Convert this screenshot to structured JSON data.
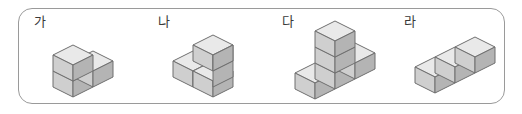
{
  "panel": {
    "border_color": "#9a9a9a",
    "background": "#ffffff",
    "corner_radius_px": 14
  },
  "cube_style": {
    "top_face_color": "#e9e9e9",
    "left_face_color": "#cfcfcf",
    "right_face_color": "#b4b4b4",
    "edge_color": "#6f6f6f",
    "shadow_color": "#dcdcdc"
  },
  "figures": [
    {
      "id": "figure-ga",
      "label": "가",
      "label_x": 33,
      "label_y": 14,
      "stage_x": 46,
      "stage_y": 24,
      "cube_count": 3,
      "shape_name": "L-shape",
      "description": "두 개의 쌓기나무가 앞줄에 나란히 놓이고 왼쪽 쌓기나무 위에 한 개가 더 쌓인 모양",
      "cubes": [
        {
          "col": 0,
          "row": 0,
          "level": 0
        },
        {
          "col": 1,
          "row": 0,
          "level": 0
        },
        {
          "col": 0,
          "row": 0,
          "level": 1
        }
      ]
    },
    {
      "id": "figure-na",
      "label": "나",
      "label_x": 157,
      "label_y": 14,
      "stage_x": 172,
      "stage_y": 24,
      "cube_count": 3,
      "shape_name": "staircase-shape",
      "description": "계단 모양으로 어긋나게 놓인 쌓기나무 세 개",
      "cubes": [
        {
          "col": 0,
          "row": 1,
          "level": 0
        },
        {
          "col": 1,
          "row": 1,
          "level": 0
        },
        {
          "col": 1,
          "row": 1,
          "level": 1
        }
      ]
    },
    {
      "id": "figure-da",
      "label": "다",
      "label_x": 281,
      "label_y": 14,
      "stage_x": 292,
      "stage_y": 19,
      "cube_count": 5,
      "shape_name": "T-shape",
      "description": "아래층에 세 개가 한 줄로 놓이고 가운데 위로 두 개가 더 쌓인 모양",
      "cubes": [
        {
          "col": 0,
          "row": 0,
          "level": 0
        },
        {
          "col": 1,
          "row": 0,
          "level": 0
        },
        {
          "col": 2,
          "row": 0,
          "level": 0
        },
        {
          "col": 1,
          "row": 0,
          "level": 1
        },
        {
          "col": 1,
          "row": 0,
          "level": 2
        }
      ]
    },
    {
      "id": "figure-ra",
      "label": "라",
      "label_x": 403,
      "label_y": 14,
      "stage_x": 412,
      "stage_y": 34,
      "cube_count": 3,
      "shape_name": "zigzag-shape",
      "description": "바닥에 지그재그로 놓인 쌓기나무 세 개",
      "cubes": [
        {
          "col": 0,
          "row": 0,
          "level": 0
        },
        {
          "col": 1,
          "row": 0,
          "level": 0
        },
        {
          "col": 1,
          "row": 1,
          "level": 0
        }
      ]
    }
  ]
}
